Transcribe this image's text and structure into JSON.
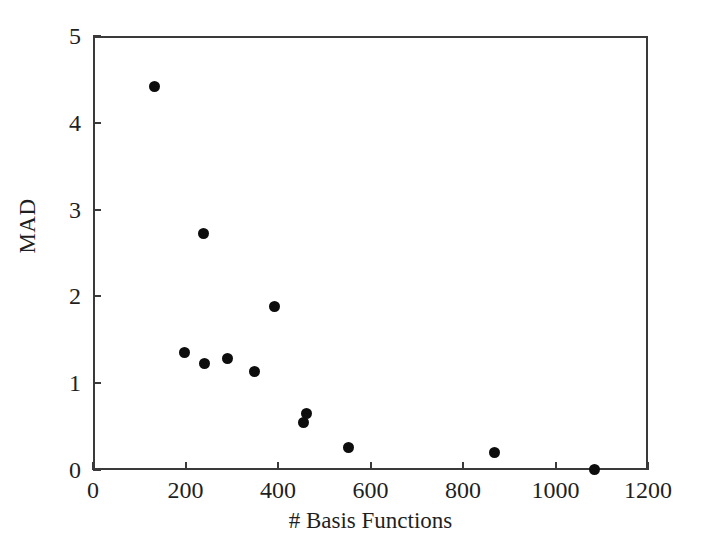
{
  "chart_data": {
    "type": "scatter",
    "title": "",
    "xlabel": "# Basis Functions",
    "ylabel": "MAD",
    "xlim": [
      0,
      1200
    ],
    "ylim": [
      0,
      5
    ],
    "xticks": [
      0,
      200,
      400,
      600,
      800,
      1000,
      1200
    ],
    "yticks": [
      0,
      1,
      2,
      3,
      4,
      5
    ],
    "xtick_labels": [
      "0",
      "200",
      "400",
      "600",
      "800",
      "1000",
      "1200"
    ],
    "ytick_labels": [
      "0",
      "1",
      "2",
      "3",
      "4",
      "5"
    ],
    "grid": false,
    "legend": null,
    "marker": "filled-circle",
    "marker_color": "#0d0d0d",
    "axis_color": "#3a3a3a",
    "background": "#ffffff",
    "points": [
      {
        "x": 132,
        "y": 4.42
      },
      {
        "x": 197,
        "y": 1.35
      },
      {
        "x": 238,
        "y": 2.72
      },
      {
        "x": 240,
        "y": 1.23
      },
      {
        "x": 290,
        "y": 1.28
      },
      {
        "x": 350,
        "y": 1.13
      },
      {
        "x": 393,
        "y": 1.88
      },
      {
        "x": 455,
        "y": 0.55
      },
      {
        "x": 462,
        "y": 0.65
      },
      {
        "x": 553,
        "y": 0.26
      },
      {
        "x": 868,
        "y": 0.2
      },
      {
        "x": 1085,
        "y": 0.01
      }
    ]
  }
}
